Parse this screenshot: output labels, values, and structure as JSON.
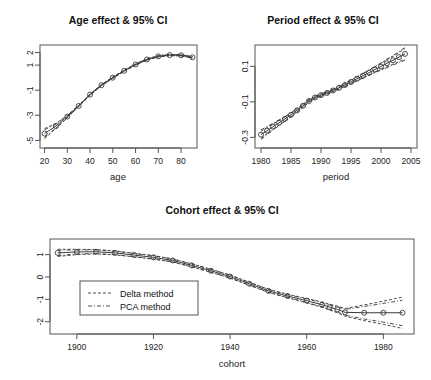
{
  "chart_data": [
    {
      "id": "age",
      "type": "line",
      "title": "Age effect & 95% CI",
      "xlabel": "age",
      "ylabel": "",
      "xlim": [
        18,
        87
      ],
      "ylim": [
        -5.6,
        2.6
      ],
      "xticks": [
        20,
        30,
        40,
        50,
        60,
        70,
        80
      ],
      "yticks": [
        2,
        1,
        -1,
        -3,
        -5
      ],
      "grid": false,
      "x": [
        20,
        25,
        30,
        35,
        40,
        45,
        50,
        55,
        60,
        65,
        70,
        75,
        80,
        85
      ],
      "estimate": [
        -4.45,
        -3.85,
        -3.1,
        -2.25,
        -1.35,
        -0.6,
        0.0,
        0.55,
        1.05,
        1.45,
        1.7,
        1.8,
        1.78,
        1.62
      ],
      "ci_delta_lower": [
        -4.85,
        -4.05,
        -3.2,
        -2.3,
        -1.4,
        -0.65,
        -0.05,
        0.5,
        1.0,
        1.4,
        1.65,
        1.75,
        1.73,
        1.55
      ],
      "ci_delta_upper": [
        -4.05,
        -3.65,
        -3.0,
        -2.2,
        -1.3,
        -0.55,
        0.05,
        0.6,
        1.1,
        1.5,
        1.75,
        1.85,
        1.83,
        1.69
      ],
      "ci_pca_lower": [
        -4.75,
        -4.0,
        -3.18,
        -2.29,
        -1.39,
        -0.64,
        -0.04,
        0.51,
        1.01,
        1.41,
        1.66,
        1.76,
        1.74,
        1.56
      ],
      "ci_pca_upper": [
        -4.15,
        -3.7,
        -3.02,
        -2.21,
        -1.31,
        -0.56,
        0.04,
        0.59,
        1.09,
        1.49,
        1.74,
        1.84,
        1.82,
        1.68
      ]
    },
    {
      "id": "period",
      "type": "line",
      "title": "Period effect & 95% CI",
      "xlabel": "period",
      "ylabel": "",
      "xlim": [
        1979,
        2006
      ],
      "ylim": [
        -0.36,
        0.22
      ],
      "xticks": [
        1980,
        1985,
        1990,
        1995,
        2000,
        2005
      ],
      "yticks": [
        0.1,
        -0.1,
        -0.3
      ],
      "grid": false,
      "x": [
        1980,
        1981,
        1982,
        1983,
        1984,
        1985,
        1986,
        1987,
        1988,
        1989,
        1990,
        1991,
        1992,
        1993,
        1994,
        1995,
        1996,
        1997,
        1998,
        1999,
        2000,
        2001,
        2002,
        2003,
        2004
      ],
      "estimate": [
        -0.285,
        -0.262,
        -0.24,
        -0.218,
        -0.196,
        -0.173,
        -0.148,
        -0.122,
        -0.095,
        -0.075,
        -0.062,
        -0.05,
        -0.036,
        -0.021,
        -0.005,
        0.012,
        0.03,
        0.047,
        0.064,
        0.082,
        0.099,
        0.117,
        0.134,
        0.152,
        0.17
      ],
      "ci_delta_lower": [
        -0.305,
        -0.279,
        -0.255,
        -0.231,
        -0.207,
        -0.183,
        -0.157,
        -0.13,
        -0.102,
        -0.081,
        -0.068,
        -0.056,
        -0.042,
        -0.028,
        -0.013,
        0.003,
        0.02,
        0.036,
        0.051,
        0.067,
        0.082,
        0.097,
        0.112,
        0.126,
        0.141
      ],
      "ci_delta_upper": [
        -0.265,
        -0.245,
        -0.225,
        -0.205,
        -0.185,
        -0.163,
        -0.139,
        -0.114,
        -0.088,
        -0.069,
        -0.056,
        -0.044,
        -0.03,
        -0.014,
        0.003,
        0.021,
        0.04,
        0.058,
        0.077,
        0.097,
        0.116,
        0.137,
        0.156,
        0.178,
        0.199
      ],
      "ci_pca_lower": [
        -0.312,
        -0.285,
        -0.259,
        -0.234,
        -0.209,
        -0.184,
        -0.158,
        -0.131,
        -0.103,
        -0.082,
        -0.069,
        -0.057,
        -0.043,
        -0.029,
        -0.014,
        0.002,
        0.018,
        0.034,
        0.049,
        0.064,
        0.079,
        0.093,
        0.107,
        0.121,
        0.134
      ],
      "ci_pca_upper": [
        -0.258,
        -0.239,
        -0.221,
        -0.202,
        -0.183,
        -0.162,
        -0.138,
        -0.113,
        -0.087,
        -0.068,
        -0.055,
        -0.043,
        -0.029,
        -0.013,
        0.004,
        0.022,
        0.042,
        0.06,
        0.079,
        0.1,
        0.119,
        0.141,
        0.161,
        0.183,
        0.206
      ]
    },
    {
      "id": "cohort",
      "type": "line",
      "title": "Cohort effect & 95% CI",
      "xlabel": "cohort",
      "ylabel": "",
      "xlim": [
        1893,
        1988
      ],
      "ylim": [
        -2.55,
        1.7
      ],
      "xticks": [
        1900,
        1920,
        1940,
        1960,
        1980
      ],
      "yticks": [
        1,
        0,
        -1,
        -2
      ],
      "grid": false,
      "legend": {
        "position": "inside-left",
        "entries": [
          {
            "label": "Delta method",
            "style": "dashed"
          },
          {
            "label": "PCA method",
            "style": "dashdot"
          }
        ]
      },
      "x": [
        1895,
        1900,
        1905,
        1910,
        1915,
        1920,
        1925,
        1930,
        1935,
        1940,
        1945,
        1950,
        1955,
        1960,
        1964,
        1966,
        1968,
        1970,
        1975,
        1980,
        1985
      ],
      "estimate": [
        1.08,
        1.12,
        1.13,
        1.08,
        0.98,
        0.88,
        0.74,
        0.52,
        0.28,
        0.02,
        -0.3,
        -0.62,
        -0.85,
        -1.06,
        -1.24,
        -1.35,
        -1.45,
        -1.58,
        -1.6,
        -1.6,
        -1.6
      ],
      "ci_delta_lower": [
        0.92,
        1.0,
        1.03,
        0.99,
        0.9,
        0.8,
        0.67,
        0.45,
        0.21,
        -0.05,
        -0.37,
        -0.69,
        -0.93,
        -1.16,
        -1.36,
        -1.48,
        -1.6,
        -1.75,
        -1.95,
        -2.12,
        -2.3
      ],
      "ci_delta_upper": [
        1.24,
        1.24,
        1.23,
        1.17,
        1.06,
        0.96,
        0.81,
        0.59,
        0.35,
        0.09,
        -0.23,
        -0.55,
        -0.77,
        -0.96,
        -1.12,
        -1.22,
        -1.3,
        -1.41,
        -1.25,
        -1.08,
        -0.9
      ],
      "ci_pca_lower": [
        0.96,
        1.03,
        1.05,
        1.0,
        0.91,
        0.81,
        0.68,
        0.46,
        0.22,
        -0.04,
        -0.36,
        -0.68,
        -0.91,
        -1.14,
        -1.33,
        -1.45,
        -1.56,
        -1.71,
        -1.88,
        -2.02,
        -2.18
      ],
      "ci_pca_upper": [
        1.2,
        1.21,
        1.21,
        1.15,
        1.05,
        0.95,
        0.8,
        0.58,
        0.34,
        0.08,
        -0.24,
        -0.56,
        -0.79,
        -0.98,
        -1.15,
        -1.25,
        -1.34,
        -1.45,
        -1.32,
        -1.18,
        -1.04
      ]
    }
  ],
  "colors": {
    "line": "#3a3a3a",
    "frame": "#555555",
    "text": "#1a1a1a",
    "background": "#ffffff"
  }
}
